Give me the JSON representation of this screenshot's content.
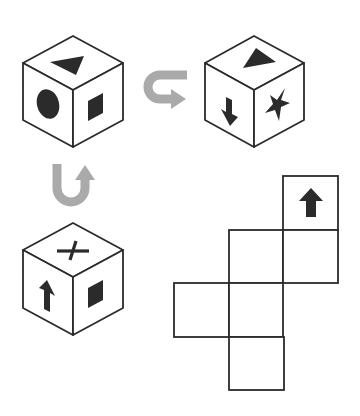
{
  "puzzle": {
    "type": "cube-net",
    "colors": {
      "line": "#2b2b2b",
      "symbol": "#2b2b2b",
      "rotation_arrow": "#aaaaaa",
      "background": "#ffffff"
    },
    "cubes": [
      {
        "id": "cube-1",
        "faces": {
          "top": "triangle",
          "left": "circle",
          "right": "square"
        }
      },
      {
        "id": "cube-2",
        "faces": {
          "top": "triangle",
          "left": "arrow-down",
          "right": "star"
        }
      },
      {
        "id": "cube-3",
        "faces": {
          "top": "cross",
          "left": "arrow-up",
          "right": "square"
        }
      }
    ],
    "rotation_arrows": [
      {
        "id": "rotate-horizontal",
        "from": "cube-1",
        "to": "cube-2",
        "icon": "u-turn-right-arrow"
      },
      {
        "id": "rotate-vertical",
        "from": "cube-3",
        "to": "cube-1",
        "icon": "u-turn-up-arrow"
      }
    ],
    "net": {
      "cells": [
        {
          "row": 0,
          "col": 2,
          "symbol": "arrow-up"
        },
        {
          "row": 1,
          "col": 1,
          "symbol": ""
        },
        {
          "row": 1,
          "col": 2,
          "symbol": ""
        },
        {
          "row": 2,
          "col": 0,
          "symbol": ""
        },
        {
          "row": 2,
          "col": 1,
          "symbol": ""
        },
        {
          "row": 3,
          "col": 1,
          "symbol": ""
        }
      ]
    }
  }
}
